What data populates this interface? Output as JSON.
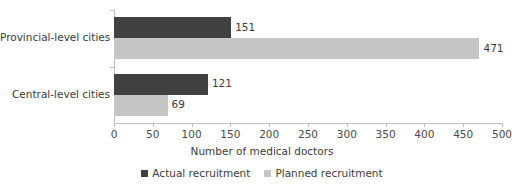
{
  "chart_data": {
    "type": "bar",
    "orientation": "horizontal",
    "title": "",
    "xlabel": "Number of medical doctors",
    "ylabel": "",
    "xlim": [
      0,
      500
    ],
    "xticks": [
      0,
      50,
      100,
      150,
      200,
      250,
      300,
      350,
      400,
      450,
      500
    ],
    "xtick_labels": [
      "0",
      "50",
      "100",
      "150",
      "200",
      "250",
      "300",
      "350",
      "400",
      "450",
      "500"
    ],
    "grid": false,
    "legend_position": "bottom",
    "categories": [
      "Provincial-level cities",
      "Central-level cities"
    ],
    "series": [
      {
        "name": "Actual recruitment",
        "color": "#414141",
        "values": [
          151,
          121
        ],
        "labels": [
          "151",
          "121"
        ]
      },
      {
        "name": "Planned recruitment",
        "color": "#c6c6c6",
        "values": [
          471,
          69
        ],
        "labels": [
          "471",
          "69"
        ]
      }
    ]
  },
  "axis": {
    "x_title": "Number of medical doctors"
  },
  "legend": {
    "items": [
      {
        "label": "Actual recruitment",
        "color": "#414141"
      },
      {
        "label": "Planned recruitment",
        "color": "#c6c6c6"
      }
    ]
  },
  "colors": {
    "actual": "#414141",
    "planned": "#c6c6c6",
    "axis": "#bfbfbf",
    "text": "#3b3b3b",
    "background": "#ffffff"
  }
}
